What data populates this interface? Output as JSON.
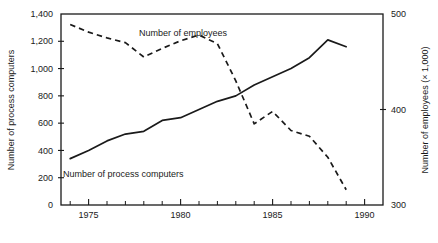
{
  "chart_data": {
    "type": "line",
    "title": "",
    "xlabel": "",
    "ylabel": "Number of process computers",
    "y2label": "Number of employees (× 1,000)",
    "grid": false,
    "legend_position": "inline-annotations",
    "xlim": [
      1973.5,
      1991.0
    ],
    "ylim": [
      0,
      1400
    ],
    "y2lim": [
      300,
      500
    ],
    "x_ticks_major": [
      1975,
      1980,
      1985,
      1990
    ],
    "x_tick_labels": [
      "1975",
      "1980",
      "1985",
      "1990"
    ],
    "x_ticks_minor": [
      1974,
      1976,
      1977,
      1978,
      1979,
      1981,
      1982,
      1983,
      1984,
      1986,
      1987,
      1988,
      1989,
      1991
    ],
    "y_ticks": [
      0,
      200,
      400,
      600,
      800,
      1000,
      1200,
      1400
    ],
    "y_tick_labels": [
      "0",
      "200",
      "400",
      "600",
      "800",
      "1,000",
      "1,200",
      "1,400"
    ],
    "y2_ticks": [
      300,
      400,
      500
    ],
    "y2_tick_labels": [
      "300",
      "400",
      "500"
    ],
    "series": [
      {
        "name": "Number of process computers",
        "axis": "left",
        "style": "solid",
        "annotation": "Number of process computers",
        "x": [
          1974,
          1975,
          1976,
          1977,
          1978,
          1979,
          1980,
          1981,
          1982,
          1983,
          1984,
          1985,
          1986,
          1987,
          1988,
          1989
        ],
        "values": [
          340,
          400,
          470,
          520,
          540,
          620,
          640,
          700,
          760,
          800,
          880,
          940,
          1000,
          1080,
          1210,
          1160
        ]
      },
      {
        "name": "Number of employees (× 1,000)",
        "axis": "right",
        "style": "dashed",
        "annotation": "Number of employees",
        "x": [
          1974,
          1975,
          1976,
          1977,
          1978,
          1979,
          1980,
          1981,
          1982,
          1983,
          1984,
          1985,
          1986,
          1987,
          1988,
          1989
        ],
        "values": [
          489,
          481,
          475,
          470,
          455,
          464,
          472,
          478,
          469,
          430,
          385,
          398,
          378,
          372,
          350,
          316
        ]
      }
    ],
    "annotations": [
      {
        "text": "Number of employees",
        "x_px": 139,
        "y_px": 36
      },
      {
        "text": "Number of process computers",
        "x_px": 63,
        "y_px": 177
      }
    ]
  },
  "axes": {
    "left_title": "Number of process computers",
    "right_title": "Number of employees (× 1,000)"
  }
}
